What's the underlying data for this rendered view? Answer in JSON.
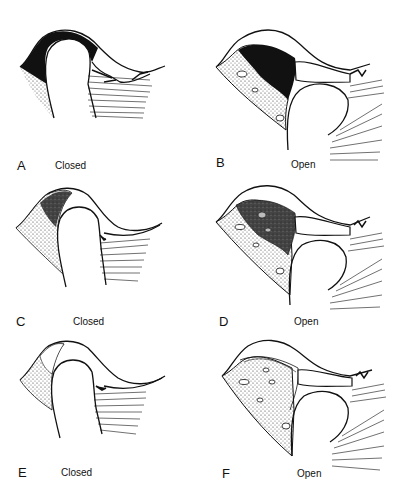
{
  "figure": {
    "panels": [
      {
        "id": "A",
        "letter": "A",
        "state": "Closed"
      },
      {
        "id": "B",
        "letter": "B",
        "state": "Open"
      },
      {
        "id": "C",
        "letter": "C",
        "state": "Closed"
      },
      {
        "id": "D",
        "letter": "D",
        "state": "Open"
      },
      {
        "id": "E",
        "letter": "E",
        "state": "Closed"
      },
      {
        "id": "F",
        "letter": "F",
        "state": "Open"
      }
    ]
  },
  "colors": {
    "ink": "#111111",
    "background": "#ffffff",
    "stipple": "#555555"
  }
}
